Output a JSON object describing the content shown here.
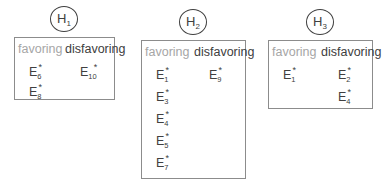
{
  "hypotheses": [
    {
      "label": "H",
      "index": "1",
      "favoring_header": "favoring",
      "disfavoring_header": "disfavoring",
      "favoring": [
        {
          "label": "E",
          "index": "6",
          "mark": "*"
        },
        {
          "label": "E",
          "index": "8",
          "mark": "*"
        }
      ],
      "disfavoring": [
        {
          "label": "E",
          "index": "10",
          "mark": "*"
        }
      ]
    },
    {
      "label": "H",
      "index": "2",
      "favoring_header": "favoring",
      "disfavoring_header": "disfavoring",
      "favoring": [
        {
          "label": "E",
          "index": "1",
          "mark": "*"
        },
        {
          "label": "E",
          "index": "3",
          "mark": "*"
        },
        {
          "label": "E",
          "index": "4",
          "mark": "*"
        },
        {
          "label": "E",
          "index": "5",
          "mark": "*"
        },
        {
          "label": "E",
          "index": "7",
          "mark": "*"
        }
      ],
      "disfavoring": [
        {
          "label": "E",
          "index": "9",
          "mark": "*"
        }
      ]
    },
    {
      "label": "H",
      "index": "3",
      "favoring_header": "favoring",
      "disfavoring_header": "disfavoring",
      "favoring": [
        {
          "label": "E",
          "index": "1",
          "mark": "*"
        }
      ],
      "disfavoring": [
        {
          "label": "E",
          "index": "2",
          "mark": "*"
        },
        {
          "label": "E",
          "index": "4",
          "mark": "*"
        }
      ]
    }
  ],
  "colors": {
    "favoring": "#a6a6a6",
    "disfavoring": "#404040",
    "border": "#8c8c8c"
  }
}
